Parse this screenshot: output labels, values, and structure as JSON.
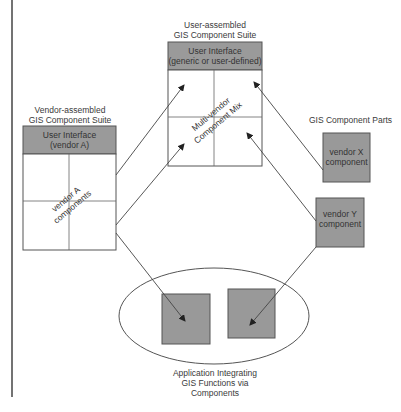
{
  "diagram": {
    "colors": {
      "line": "#555555",
      "header_fill": "#9a9a9a",
      "component_fill": "#999999",
      "background": "#ffffff"
    },
    "vendor_suite": {
      "title_line1": "Vendor-assembled",
      "title_line2": "GIS Component Suite",
      "header_line1": "User Interface",
      "header_line2": "(vendor A)",
      "body_line1": "vendor A",
      "body_line2": "components"
    },
    "user_suite": {
      "title_line1": "User-assembled",
      "title_line2": "GIS Component Suite",
      "header_line1": "User Interface",
      "header_line2": "(generic or user-defined)",
      "body_line1": "Multi-vendor",
      "body_line2": "Component Mix"
    },
    "component_parts": {
      "title": "GIS Component Parts",
      "vendor_x_line1": "vendor X",
      "vendor_x_line2": "component",
      "vendor_y_line1": "vendor Y",
      "vendor_y_line2": "component"
    },
    "application": {
      "caption_line1": "Application Integrating",
      "caption_line2": "GIS Functions via",
      "caption_line3": "Components"
    }
  }
}
